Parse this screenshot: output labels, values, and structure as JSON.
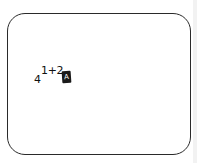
{
  "screen": {
    "expression": {
      "base": "4",
      "exponent": "1+2",
      "cursor_glyph": "A"
    }
  },
  "colors": {
    "border": "#2a2a2a",
    "text": "#111111",
    "cursor_bg": "#1a1a1a",
    "background": "#ffffff"
  }
}
